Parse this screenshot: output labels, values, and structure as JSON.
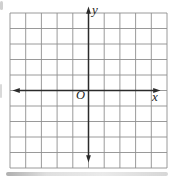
{
  "figure": {
    "type": "coordinate-plane",
    "grid": {
      "columns": 10,
      "rows": 10
    },
    "axes": {
      "x_label": "x",
      "y_label": "y",
      "origin_label": "O"
    },
    "colors": {
      "background": "#ffffff",
      "grid_line": "#8f8f8f",
      "axis": "#2b2b2b",
      "label": "#1d1d1d"
    }
  }
}
